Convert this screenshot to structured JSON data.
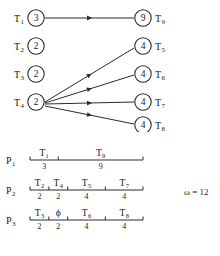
{
  "figure": {
    "omega_label": "ω = 12"
  },
  "graph": {
    "left_nodes": [
      {
        "name": "T",
        "sub": "1",
        "value": "3",
        "cx": 36,
        "cy": 18
      },
      {
        "name": "T",
        "sub": "2",
        "value": "2",
        "cx": 36,
        "cy": 46
      },
      {
        "name": "T",
        "sub": "3",
        "value": "2",
        "cx": 36,
        "cy": 74
      },
      {
        "name": "T",
        "sub": "4",
        "value": "2",
        "cx": 36,
        "cy": 102
      }
    ],
    "right_nodes": [
      {
        "name": "T",
        "sub": "9",
        "value": "9",
        "cx": 143,
        "cy": 18
      },
      {
        "name": "T",
        "sub": "5",
        "value": "4",
        "cx": 143,
        "cy": 46
      },
      {
        "name": "T",
        "sub": "6",
        "value": "4",
        "cx": 143,
        "cy": 74
      },
      {
        "name": "T",
        "sub": "7",
        "value": "4",
        "cx": 143,
        "cy": 102
      },
      {
        "name": "T",
        "sub": "8",
        "value": "4",
        "cx": 143,
        "cy": 125
      }
    ],
    "edges": [
      {
        "from": "T1",
        "to": "T9",
        "x1": 45,
        "y1": 18,
        "x2": 134,
        "y2": 18
      },
      {
        "from": "T4",
        "to": "T5",
        "x1": 45,
        "y1": 102,
        "x2": 134,
        "y2": 48
      },
      {
        "from": "T4",
        "to": "T6",
        "x1": 45,
        "y1": 103,
        "x2": 134,
        "y2": 75
      },
      {
        "from": "T4",
        "to": "T7",
        "x1": 45,
        "y1": 104,
        "x2": 134,
        "y2": 102
      },
      {
        "from": "T4",
        "to": "T8",
        "x1": 45,
        "y1": 106,
        "x2": 134,
        "y2": 124
      }
    ]
  },
  "schedule": {
    "omega": "ω = 12",
    "total_time": 12,
    "processors": [
      {
        "label": "P",
        "sub": "1",
        "slots": [
          {
            "task": "T",
            "task_sub": "1",
            "duration": "3"
          },
          {
            "task": "T",
            "task_sub": "9",
            "duration": "9"
          }
        ]
      },
      {
        "label": "P",
        "sub": "2",
        "slots": [
          {
            "task": "T",
            "task_sub": "2",
            "duration": "2"
          },
          {
            "task": "T",
            "task_sub": "4",
            "duration": "2"
          },
          {
            "task": "T",
            "task_sub": "5",
            "duration": "4"
          },
          {
            "task": "T",
            "task_sub": "7",
            "duration": "4"
          }
        ]
      },
      {
        "label": "P",
        "sub": "3",
        "slots": [
          {
            "task": "T",
            "task_sub": "3",
            "duration": "2"
          },
          {
            "task": "ϕ",
            "task_sub": "",
            "duration": "2"
          },
          {
            "task": "T",
            "task_sub": "6",
            "duration": "4"
          },
          {
            "task": "T",
            "task_sub": "8",
            "duration": "4"
          }
        ]
      }
    ]
  }
}
